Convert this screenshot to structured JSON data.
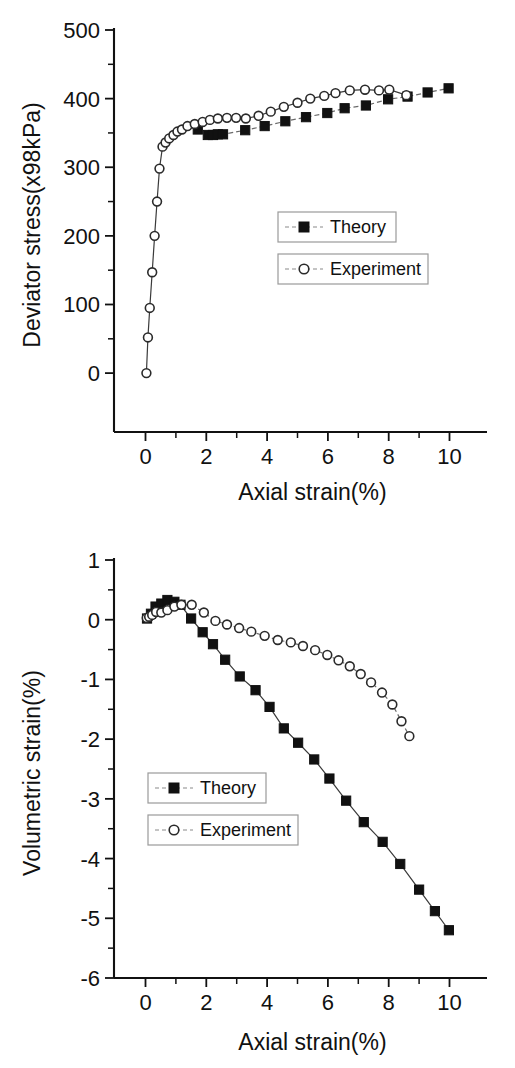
{
  "charts": [
    {
      "id": "deviator-stress",
      "ylabel": "Deviator stress(x98kPa)",
      "xlabel": "Axial strain(%)",
      "xticks": [
        "0",
        "2",
        "4",
        "6",
        "8",
        "10"
      ],
      "yticks": [
        "0",
        "100",
        "200",
        "300",
        "400",
        "500"
      ],
      "legend": [
        {
          "label": "Theory",
          "marker": "filled-square"
        },
        {
          "label": "Experiment",
          "marker": "open-circle"
        }
      ]
    },
    {
      "id": "volumetric-strain",
      "ylabel": "Volumetric strain(%)",
      "xlabel": "Axial strain(%)",
      "xticks": [
        "0",
        "2",
        "4",
        "6",
        "8",
        "10"
      ],
      "yticks": [
        "-6",
        "-5",
        "-4",
        "-3",
        "-2",
        "-1",
        "0",
        "1"
      ],
      "legend": [
        {
          "label": "Theory",
          "marker": "filled-square"
        },
        {
          "label": "Experiment",
          "marker": "open-circle"
        }
      ]
    }
  ],
  "chart_data": [
    {
      "type": "line",
      "title": "",
      "xlabel": "Axial strain(%)",
      "ylabel": "Deviator stress(x98kPa)",
      "xlim": [
        -0.5,
        11.2
      ],
      "ylim": [
        -45,
        500
      ],
      "xticks": [
        0,
        2,
        4,
        6,
        8,
        10
      ],
      "yticks": [
        0,
        100,
        200,
        300,
        400,
        500
      ],
      "grid": false,
      "legend_position": "center-right",
      "series": [
        {
          "name": "Theory",
          "marker": "filled-square",
          "linestyle": "dashed",
          "x": [
            1.72,
            2.05,
            2.22,
            2.38,
            2.55,
            3.28,
            3.92,
            4.6,
            5.28,
            5.98,
            6.55,
            7.25,
            7.98,
            8.62,
            9.28,
            9.97
          ],
          "y": [
            355,
            347,
            347,
            348,
            348,
            354,
            360,
            367,
            373,
            379,
            386,
            390,
            399,
            403,
            409,
            415
          ]
        },
        {
          "name": "Experiment",
          "marker": "open-circle",
          "linestyle": "solid",
          "x": [
            0.03,
            0.08,
            0.14,
            0.22,
            0.3,
            0.38,
            0.46,
            0.56,
            0.66,
            0.78,
            0.92,
            1.05,
            1.2,
            1.38,
            1.62,
            1.88,
            2.12,
            2.38,
            2.68,
            2.98,
            3.3,
            3.72,
            4.12,
            4.55,
            5.0,
            5.42,
            5.88,
            6.25,
            6.72,
            7.22,
            7.68,
            8.02,
            8.58
          ],
          "y": [
            0,
            52,
            95,
            147,
            200,
            250,
            298,
            330,
            336,
            342,
            347,
            352,
            355,
            360,
            363,
            366,
            369,
            371,
            372,
            372,
            371,
            375,
            381,
            388,
            394,
            400,
            404,
            408,
            412,
            413,
            412,
            413,
            405
          ]
        }
      ]
    },
    {
      "type": "line",
      "title": "",
      "xlabel": "Axial strain(%)",
      "ylabel": "Volumetric strain(%)",
      "xlim": [
        -0.5,
        11.2
      ],
      "ylim": [
        -6,
        1
      ],
      "xticks": [
        0,
        2,
        4,
        6,
        8,
        10
      ],
      "yticks": [
        -6,
        -5,
        -4,
        -3,
        -2,
        -1,
        0,
        1
      ],
      "grid": false,
      "legend_position": "center-left",
      "series": [
        {
          "name": "Theory",
          "marker": "filled-square",
          "linestyle": "solid",
          "x": [
            0.05,
            0.18,
            0.33,
            0.52,
            0.72,
            0.95,
            1.15,
            1.5,
            1.88,
            2.22,
            2.62,
            3.1,
            3.62,
            4.08,
            4.55,
            5.02,
            5.55,
            6.05,
            6.6,
            7.18,
            7.8,
            8.38,
            9.0,
            9.52,
            9.98
          ],
          "y": [
            0.02,
            0.1,
            0.22,
            0.27,
            0.33,
            0.3,
            0.25,
            0.02,
            -0.21,
            -0.41,
            -0.67,
            -0.95,
            -1.18,
            -1.46,
            -1.82,
            -2.06,
            -2.34,
            -2.66,
            -3.03,
            -3.39,
            -3.72,
            -4.09,
            -4.52,
            -4.88,
            -5.2
          ]
        },
        {
          "name": "Experiment",
          "marker": "open-circle",
          "linestyle": "dashed",
          "x": [
            0.04,
            0.12,
            0.22,
            0.35,
            0.52,
            0.72,
            0.95,
            1.18,
            1.52,
            1.92,
            2.3,
            2.68,
            3.08,
            3.48,
            3.92,
            4.35,
            4.78,
            5.18,
            5.58,
            5.98,
            6.35,
            6.72,
            7.08,
            7.42,
            7.78,
            8.12,
            8.42,
            8.68
          ],
          "y": [
            0.03,
            0.05,
            0.08,
            0.13,
            0.12,
            0.16,
            0.22,
            0.25,
            0.25,
            0.12,
            -0.02,
            -0.08,
            -0.14,
            -0.2,
            -0.27,
            -0.34,
            -0.38,
            -0.44,
            -0.51,
            -0.59,
            -0.68,
            -0.78,
            -0.91,
            -1.05,
            -1.22,
            -1.42,
            -1.7,
            -1.95
          ]
        }
      ]
    }
  ]
}
